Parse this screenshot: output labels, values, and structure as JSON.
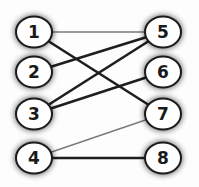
{
  "diagram": {
    "type": "bipartite-graph",
    "left_nodes": [
      {
        "id": "1",
        "label": "1",
        "cx": 34,
        "cy": 32
      },
      {
        "id": "2",
        "label": "2",
        "cx": 34,
        "cy": 72
      },
      {
        "id": "3",
        "label": "3",
        "cx": 34,
        "cy": 114
      },
      {
        "id": "4",
        "label": "4",
        "cx": 34,
        "cy": 158
      }
    ],
    "right_nodes": [
      {
        "id": "5",
        "label": "5",
        "cx": 163,
        "cy": 32
      },
      {
        "id": "6",
        "label": "6",
        "cx": 163,
        "cy": 72
      },
      {
        "id": "7",
        "label": "7",
        "cx": 163,
        "cy": 114
      },
      {
        "id": "8",
        "label": "8",
        "cx": 163,
        "cy": 158
      }
    ],
    "edges": [
      {
        "from": "1",
        "to": "5",
        "style": "thin",
        "color": "#7a7a7a"
      },
      {
        "from": "1",
        "to": "7",
        "style": "thick",
        "color": "#1e1e1e"
      },
      {
        "from": "2",
        "to": "5",
        "style": "thick",
        "color": "#1e1e1e"
      },
      {
        "from": "3",
        "to": "5",
        "style": "thick",
        "color": "#1e1e1e"
      },
      {
        "from": "3",
        "to": "6",
        "style": "thick",
        "color": "#1e1e1e"
      },
      {
        "from": "4",
        "to": "7",
        "style": "thin",
        "color": "#7a7a7a"
      },
      {
        "from": "4",
        "to": "8",
        "style": "thick",
        "color": "#1e1e1e"
      }
    ],
    "colors": {
      "node_fill": "#ffffff",
      "node_stroke": "#1a1a1a",
      "node_shadow": "#555555"
    }
  }
}
